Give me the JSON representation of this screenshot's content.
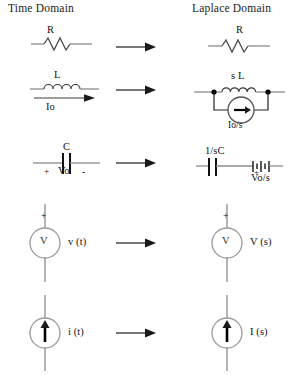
{
  "headers": {
    "left": "Time Domain",
    "right": "Laplace Domain"
  },
  "rows": [
    {
      "id": "resistor",
      "time": {
        "label_top": "R"
      },
      "laplace": {
        "label_top": "R"
      }
    },
    {
      "id": "inductor",
      "time": {
        "label_top": "L",
        "label_bottom": "Io"
      },
      "laplace": {
        "label_top": "s L",
        "label_bottom": "Io/s"
      }
    },
    {
      "id": "capacitor",
      "time": {
        "label_top": "C",
        "polarity_plus": "+",
        "label_bottom": "Vo",
        "polarity_minus": "-"
      },
      "laplace": {
        "label_top": "1/sC",
        "polarity_plus": "+",
        "label_bottom": "Vo/s"
      }
    },
    {
      "id": "voltage-source",
      "time": {
        "polarity_plus": "+",
        "symbol": "V",
        "label_side": "v (t)"
      },
      "laplace": {
        "polarity_plus": "+",
        "symbol": "V",
        "label_side": "V (s)"
      }
    },
    {
      "id": "current-source",
      "time": {
        "label_side": "i (t)"
      },
      "laplace": {
        "label_side": "I (s)"
      }
    }
  ],
  "icons": {
    "transform_arrow": "right-arrow-icon",
    "resistor": "resistor-icon",
    "inductor": "inductor-icon",
    "capacitor": "capacitor-icon",
    "battery": "battery-icon",
    "voltage_source": "voltage-source-icon",
    "current_source": "current-source-icon",
    "node": "junction-dot-icon"
  },
  "colors": {
    "background": "#ffffff",
    "wire": "#8c8c8c",
    "symbol": "#1a1a1a",
    "text": "#111111"
  }
}
